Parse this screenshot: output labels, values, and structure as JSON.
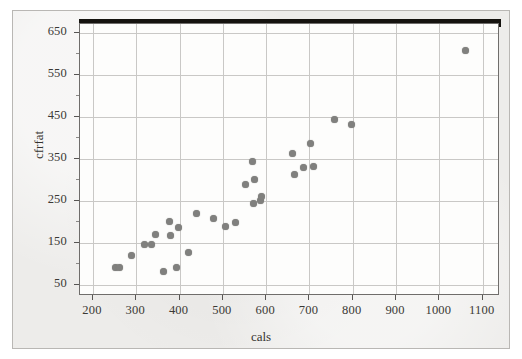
{
  "chart_data": {
    "type": "scatter",
    "title": "",
    "xlabel": "cals",
    "ylabel": "cfrfat",
    "xlim": [
      170,
      1140
    ],
    "ylim": [
      25,
      672
    ],
    "xticks": [
      200,
      300,
      400,
      500,
      600,
      700,
      800,
      900,
      1000,
      1100
    ],
    "yticks": [
      50,
      150,
      250,
      350,
      450,
      550,
      650
    ],
    "grid": true,
    "legend": null,
    "marker": {
      "shape": "circle",
      "color": "#80807e",
      "size": 7
    },
    "points": [
      {
        "x": 252,
        "y": 92
      },
      {
        "x": 262,
        "y": 92
      },
      {
        "x": 288,
        "y": 122
      },
      {
        "x": 318,
        "y": 148
      },
      {
        "x": 336,
        "y": 148
      },
      {
        "x": 345,
        "y": 172
      },
      {
        "x": 362,
        "y": 84
      },
      {
        "x": 376,
        "y": 202
      },
      {
        "x": 378,
        "y": 168
      },
      {
        "x": 392,
        "y": 92
      },
      {
        "x": 398,
        "y": 188
      },
      {
        "x": 420,
        "y": 128
      },
      {
        "x": 440,
        "y": 222
      },
      {
        "x": 478,
        "y": 210
      },
      {
        "x": 506,
        "y": 190
      },
      {
        "x": 530,
        "y": 199
      },
      {
        "x": 552,
        "y": 291
      },
      {
        "x": 568,
        "y": 344
      },
      {
        "x": 570,
        "y": 245
      },
      {
        "x": 574,
        "y": 301
      },
      {
        "x": 588,
        "y": 252
      },
      {
        "x": 589,
        "y": 262
      },
      {
        "x": 660,
        "y": 363
      },
      {
        "x": 665,
        "y": 313
      },
      {
        "x": 686,
        "y": 330
      },
      {
        "x": 703,
        "y": 388
      },
      {
        "x": 710,
        "y": 334
      },
      {
        "x": 758,
        "y": 444
      },
      {
        "x": 798,
        "y": 433
      },
      {
        "x": 1060,
        "y": 610
      }
    ]
  },
  "axes": {
    "x_tick_labels": [
      "200",
      "300",
      "400",
      "500",
      "600",
      "700",
      "800",
      "900",
      "1000",
      "1100"
    ],
    "y_tick_labels": [
      "650",
      "550",
      "450",
      "350",
      "250",
      "150",
      "50"
    ],
    "x_axis_title": "cals",
    "y_axis_title": "cfrfat"
  },
  "colors": {
    "figure_background": "#edecea",
    "plot_background": "#fdfdfc",
    "gridline": "#c9c8c6",
    "frame": "#6f6d6b",
    "marker": "#80807e",
    "text": "#35332f",
    "scan_band": "#15130f"
  }
}
